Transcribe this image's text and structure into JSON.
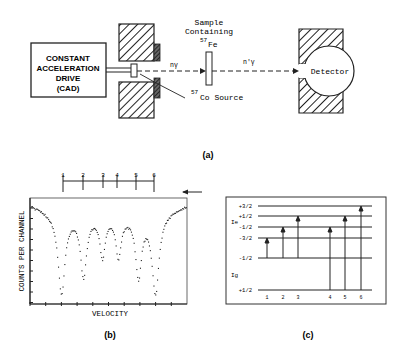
{
  "panel_a": {
    "caption": "(a)",
    "cad_box": {
      "line1": "CONSTANT",
      "line2": "ACCELERATION",
      "line3": "DRIVE",
      "line4": "(CAD)"
    },
    "sample_label": {
      "line1": "Sample",
      "line2": "Containing",
      "isotope_mass": "57",
      "isotope_symbol": "Fe"
    },
    "source_label": {
      "isotope_mass": "57",
      "isotope_symbol": "Co Source"
    },
    "beam_in_label": "nγ",
    "beam_out_label": "n'γ",
    "detector_label": "Detector"
  },
  "panel_b": {
    "caption": "(b)",
    "ylabel": "COUNTS PER CHANNEL",
    "xlabel": "VELOCITY",
    "line_markers": [
      "1",
      "2",
      "3",
      "4",
      "5",
      "6"
    ]
  },
  "panel_c": {
    "caption": "(c)",
    "excited_label": "Ie",
    "ground_label": "Ig",
    "excited_levels": [
      "+3/2",
      "+1/2",
      "-1/2",
      "-3/2"
    ],
    "ground_levels": [
      "-1/2",
      "+1/2"
    ],
    "transitions": [
      "1",
      "2",
      "3",
      "4",
      "5",
      "6"
    ]
  },
  "chart_data": {
    "type": "scatter",
    "title": "",
    "xlabel": "VELOCITY",
    "ylabel": "COUNTS PER CHANNEL",
    "series": [
      {
        "name": "57Fe Mossbauer sextet",
        "line_positions": [
          1,
          2,
          3,
          4,
          5,
          6
        ],
        "relative_depth": [
          0.93,
          0.72,
          0.48,
          0.48,
          0.72,
          0.93
        ]
      }
    ],
    "grid": false
  }
}
